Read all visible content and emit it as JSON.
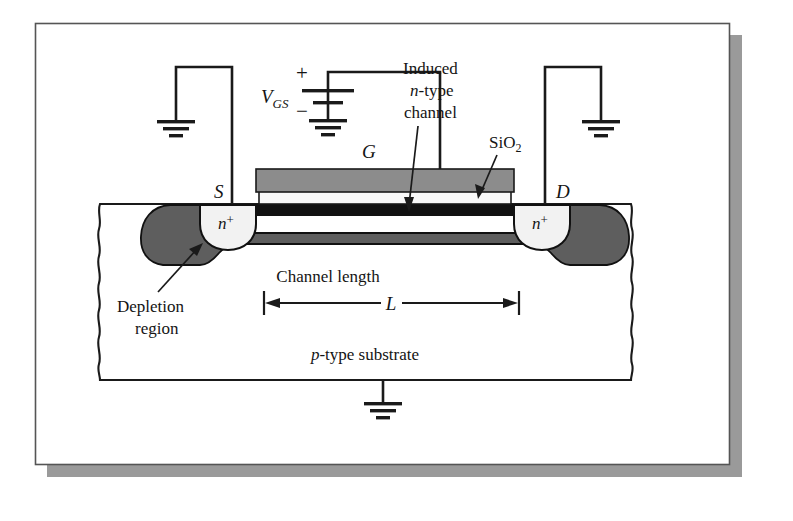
{
  "figure": {
    "frame": {
      "border_color": "#555555",
      "shadow_color": "#9a9a9a",
      "background": "#ffffff"
    },
    "colors": {
      "gate_gray": "#8c8c8c",
      "depletion_gray": "#5e5e5e",
      "channel_black": "#111111",
      "oxide_white": "#f6f6f6",
      "nplus_white": "#f2f2f2",
      "line_black": "#1a1a1a",
      "substrate_white": "#ffffff"
    },
    "labels": {
      "vgs": "V",
      "vgs_sub": "GS",
      "plus": "+",
      "minus": "−",
      "induced_line1": "Induced",
      "induced_line2_ital": "n",
      "induced_line2_rest": "-type",
      "induced_line3": "channel",
      "sio2": "SiO",
      "sio2_sub": "2",
      "gate": "G",
      "source": "S",
      "drain": "D",
      "nplus_source_base": "n",
      "nplus_source_sup": "+",
      "nplus_drain_base": "n",
      "nplus_drain_sup": "+",
      "channel_length": "Channel length",
      "length_symbol": "L",
      "depletion_line1": "Depletion",
      "depletion_line2": "region",
      "substrate_ital": "p",
      "substrate_rest": "-type substrate"
    },
    "icons": {
      "ground_source": "ground-icon",
      "ground_battery": "ground-icon",
      "ground_drain": "ground-icon",
      "ground_body": "ground-icon",
      "battery": "battery-cell-icon",
      "arrow_channel": "arrow-pointer-icon",
      "arrow_sio2": "arrow-pointer-icon",
      "arrow_depletion": "arrow-pointer-icon",
      "dimension_arrow": "double-headed-arrow-icon"
    }
  }
}
